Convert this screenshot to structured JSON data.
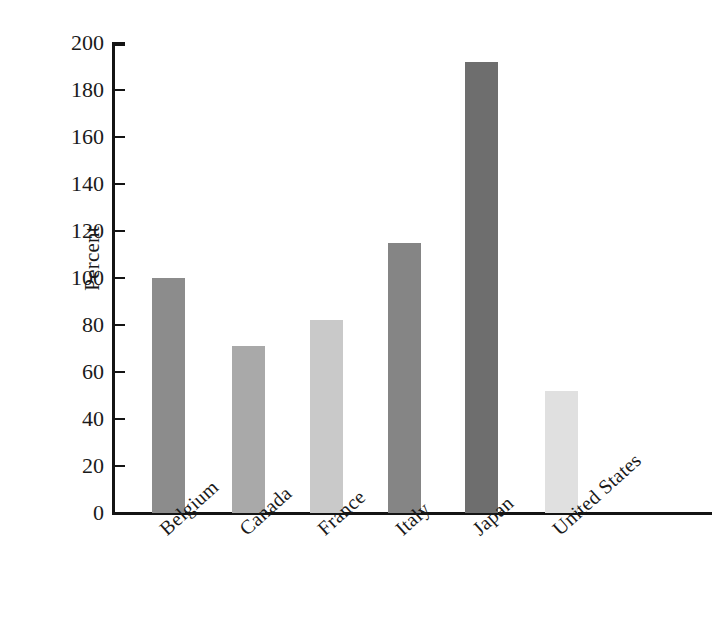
{
  "chart_data": {
    "type": "bar",
    "title": "",
    "subtitle": "",
    "xlabel": "",
    "ylabel": "Percent",
    "categories": [
      "Belgium",
      "Canada",
      "France",
      "Italy",
      "Japan",
      "United States"
    ],
    "values": [
      100,
      71,
      82,
      115,
      192,
      52
    ],
    "series": [
      {
        "name": "Percent",
        "values": [
          100,
          71,
          82,
          115,
          192,
          52
        ]
      }
    ],
    "bar_colors": [
      "#8c8c8c",
      "#a9a9a9",
      "#c9c9c9",
      "#858585",
      "#6e6e6e",
      "#e0e0e0"
    ],
    "ylim": [
      0,
      200
    ],
    "ytick_values": [
      0,
      20,
      40,
      60,
      80,
      100,
      120,
      140,
      160,
      180,
      200
    ],
    "ytick_labels": [
      "0",
      "20",
      "40",
      "60",
      "80",
      "100",
      "120",
      "140",
      "160",
      "180",
      "200"
    ],
    "ytick_step": 20,
    "grid": false,
    "legend": false,
    "legend_position": "none",
    "axis_color": "#141414",
    "background_color": "#ffffff",
    "category_label_rotation_deg": -42
  }
}
